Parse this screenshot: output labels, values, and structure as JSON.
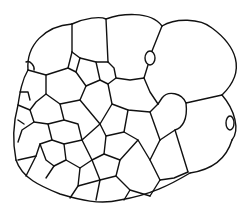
{
  "figure": {
    "colors": {
      "background": "#ffffff",
      "stroke": "#111111"
    }
  }
}
